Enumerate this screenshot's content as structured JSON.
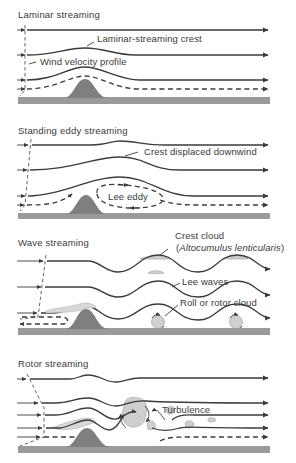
{
  "figure": {
    "colors": {
      "line": "#3b3b3b",
      "ground": "#9a9a9a",
      "hill": "#7f7f7f",
      "cloud": "#cfcfcf",
      "background": "#ffffff"
    },
    "panels": [
      {
        "title": "Laminar streaming",
        "labels": {
          "crest": "Laminar-streaming crest",
          "profile": "Wind velocity profile"
        }
      },
      {
        "title": "Standing eddy streaming",
        "labels": {
          "crest": "Crest displaced downwind",
          "eddy": "Lee eddy"
        }
      },
      {
        "title": "Wave streaming",
        "labels": {
          "crest_cloud": "Crest cloud",
          "crest_cloud_latin": "Altocumulus lenticularis",
          "lee_waves": "Lee waves",
          "rotor_cloud": "Roll or rotor cloud"
        }
      },
      {
        "title": "Rotor streaming",
        "labels": {
          "turbulence": "Turbulence"
        }
      }
    ]
  }
}
